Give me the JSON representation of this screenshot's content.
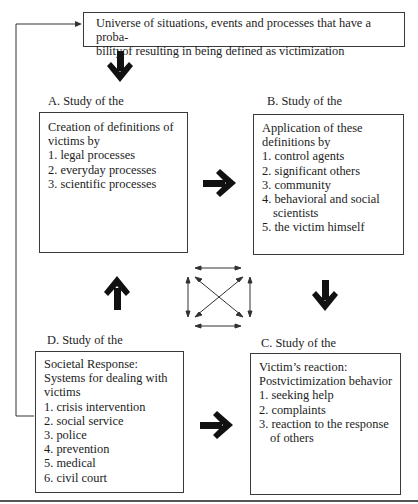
{
  "universe_box": {
    "line1": "Universe of situations, events and processes that have a proba-",
    "line2": "bilityof resulting in being defined as victimization"
  },
  "section_a": {
    "label": "A. Study of the",
    "lines": [
      "Creation of definitions of",
      "victims by",
      "1. legal processes",
      "2. everyday processes",
      "3. scientific processes"
    ]
  },
  "section_b": {
    "label": "B. Study of the",
    "lines": [
      "Application of these",
      "definitions by",
      "1. control agents",
      "2. significant others",
      "3. community",
      "4. behavioral and social",
      "scientists",
      "5. the victim himself"
    ]
  },
  "section_c": {
    "label": "C. Study of the",
    "lines": [
      "Victim’s reaction:",
      "Postvictimization behavior",
      "1. seeking help",
      "2. complaints",
      "3. reaction to the response",
      "of others"
    ]
  },
  "section_d": {
    "label": "D. Study of the",
    "lines": [
      "Societal Response:",
      "Systems for dealing with",
      "victims",
      "1. crisis intervention",
      "2. social service",
      "3. police",
      "4. prevention",
      "5. medical",
      "6. civil court"
    ]
  },
  "arrows": {
    "universe_to_a": "arrow-down",
    "a_to_b": "arrow-right",
    "b_to_c": "arrow-down",
    "d_to_c": "arrow-right",
    "d_to_a": "arrow-up",
    "center": "bidirectional-interaction",
    "feedback": "d-to-universe-feedback-line"
  },
  "colors": {
    "ink": "#1c1c1c",
    "border": "#3a3a3a"
  }
}
